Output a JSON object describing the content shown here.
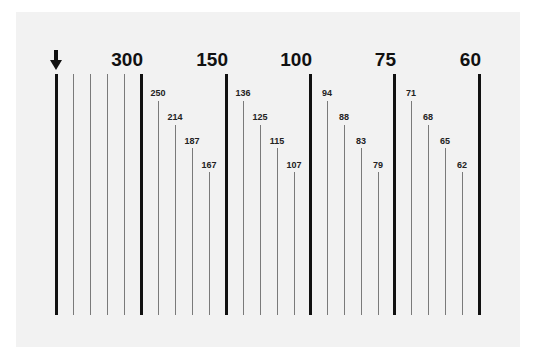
{
  "diagram": {
    "marker": {
      "icon": "down-arrow-icon",
      "x": 56
    },
    "major_ticks": [
      {
        "x": 56,
        "label": ""
      },
      {
        "x": 141,
        "label": "300"
      },
      {
        "x": 226,
        "label": "150"
      },
      {
        "x": 310,
        "label": "100"
      },
      {
        "x": 394,
        "label": "75"
      },
      {
        "x": 479,
        "label": "60"
      }
    ],
    "minor_ticks": [
      {
        "x": 73,
        "top": 74,
        "label": ""
      },
      {
        "x": 90,
        "top": 74,
        "label": ""
      },
      {
        "x": 107,
        "top": 74,
        "label": ""
      },
      {
        "x": 124,
        "top": 74,
        "label": ""
      },
      {
        "x": 158,
        "top": 101,
        "label": "250",
        "label_top": 88
      },
      {
        "x": 175,
        "top": 125,
        "label": "214",
        "label_top": 112
      },
      {
        "x": 192,
        "top": 148,
        "label": "187",
        "label_top": 136
      },
      {
        "x": 209,
        "top": 172,
        "label": "167",
        "label_top": 160
      },
      {
        "x": 243,
        "top": 101,
        "label": "136",
        "label_top": 88
      },
      {
        "x": 260,
        "top": 125,
        "label": "125",
        "label_top": 112
      },
      {
        "x": 277,
        "top": 148,
        "label": "115",
        "label_top": 136
      },
      {
        "x": 294,
        "top": 172,
        "label": "107",
        "label_top": 160
      },
      {
        "x": 327,
        "top": 101,
        "label": "94",
        "label_top": 88
      },
      {
        "x": 344,
        "top": 125,
        "label": "88",
        "label_top": 112
      },
      {
        "x": 361,
        "top": 148,
        "label": "83",
        "label_top": 136
      },
      {
        "x": 378,
        "top": 172,
        "label": "79",
        "label_top": 160
      },
      {
        "x": 411,
        "top": 101,
        "label": "71",
        "label_top": 88
      },
      {
        "x": 428,
        "top": 125,
        "label": "68",
        "label_top": 112
      },
      {
        "x": 445,
        "top": 148,
        "label": "65",
        "label_top": 136
      },
      {
        "x": 462,
        "top": 172,
        "label": "62",
        "label_top": 160
      }
    ],
    "colors": {
      "panel": "#f2f2f2",
      "major": "#111111",
      "minor": "#7a7a7a"
    }
  }
}
